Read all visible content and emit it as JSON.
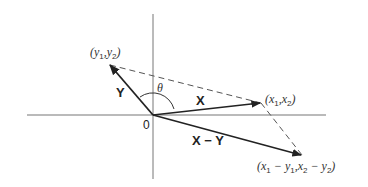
{
  "diagram": {
    "type": "vector-subtraction",
    "origin": {
      "label": "0",
      "x": 153,
      "y": 115
    },
    "axes": {
      "horizontal": {
        "x1": 27,
        "x2": 326,
        "y": 115
      },
      "vertical": {
        "x": 153,
        "y1": 14,
        "y2": 179
      }
    },
    "vectors": [
      {
        "name": "Y",
        "label": "Y",
        "tip": {
          "x": 109,
          "y": 64
        },
        "point_label": {
          "prefix": "(",
          "a": "y",
          "a_sub": "1",
          "sep": ",",
          "b": "y",
          "b_sub": "2",
          "suffix": ")"
        }
      },
      {
        "name": "X",
        "label": "X",
        "tip": {
          "x": 261,
          "y": 103
        },
        "point_label": {
          "prefix": "(",
          "a": "x",
          "a_sub": "1",
          "sep": ",",
          "b": "x",
          "b_sub": "2",
          "suffix": ")"
        }
      },
      {
        "name": "X-Y",
        "label": "X − Y",
        "tip": {
          "x": 302,
          "y": 155
        },
        "point_label": {
          "text": "(x1 − y1, x2 − y2)"
        }
      }
    ],
    "angle": {
      "label": "θ"
    },
    "labels": {
      "origin": "0",
      "theta": "θ",
      "vec_y": "Y",
      "vec_x": "X",
      "vec_x_minus_y": "X − Y",
      "pt_y_open": "(",
      "pt_y_a": "y",
      "pt_y_a_sub": "1",
      "pt_y_sep": ",",
      "pt_y_b": "y",
      "pt_y_b_sub": "2",
      "pt_y_close": ")",
      "pt_x_open": "(",
      "pt_x_a": "x",
      "pt_x_a_sub": "1",
      "pt_x_sep": ",",
      "pt_x_b": "x",
      "pt_x_b_sub": "2",
      "pt_x_close": ")",
      "pt_d_open": "(",
      "pt_d_a": "x",
      "pt_d_a_sub": "1",
      "pt_d_minus1": " − ",
      "pt_d_b": "y",
      "pt_d_b_sub": "1",
      "pt_d_sep": ",",
      "pt_d_c": "x",
      "pt_d_c_sub": "2",
      "pt_d_minus2": " − ",
      "pt_d_d": "y",
      "pt_d_d_sub": "2",
      "pt_d_close": ")"
    },
    "colors": {
      "axis": "#666666",
      "vector": "#222222",
      "dashed": "#555555"
    }
  }
}
